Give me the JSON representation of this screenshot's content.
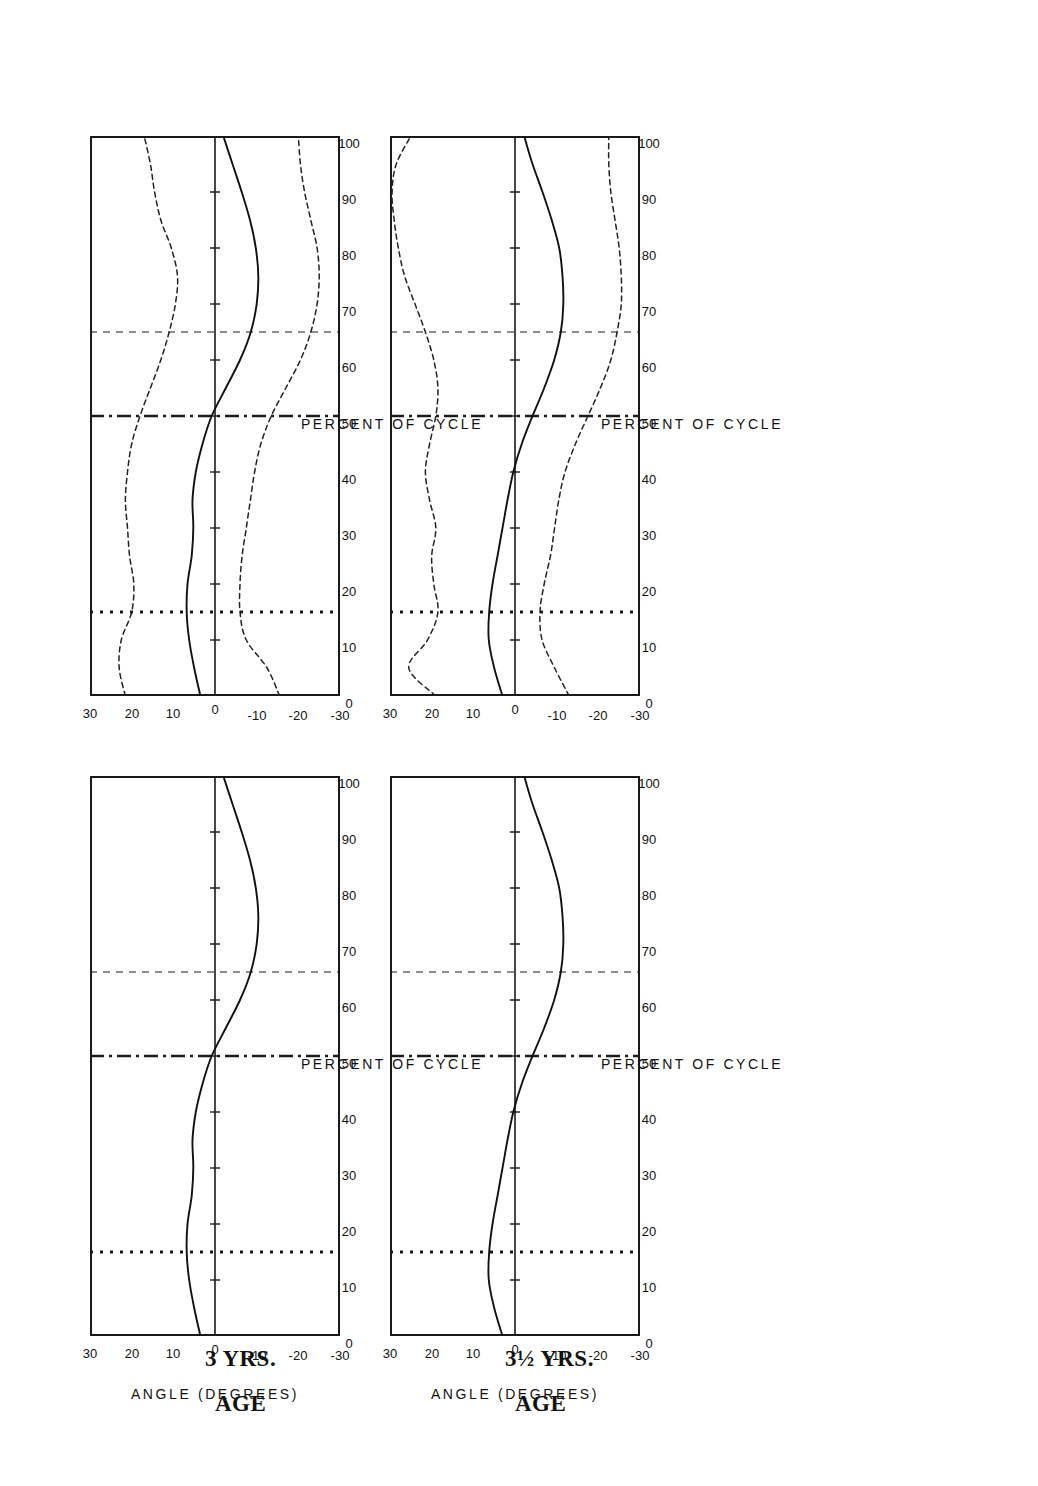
{
  "figure": {
    "title": "FEMORAL ROTATION",
    "xlabel": "PERCENT OF CYCLE",
    "ylabel_line1": "ANGLE",
    "ylabel_line2": "(DEGREES)",
    "row_labels": [
      {
        "age_word": "AGE",
        "age_value": "3 YRS."
      },
      {
        "age_word": "AGE",
        "age_value": "3½ YRS."
      }
    ],
    "xticks": [
      "0",
      "10",
      "20",
      "30",
      "40",
      "50",
      "60",
      "70",
      "80",
      "90",
      "100"
    ],
    "yticks": [
      "30",
      "20",
      "10",
      "0",
      "-10",
      "-20",
      "-30"
    ],
    "colors": {
      "ink": "#1a1a1a",
      "mean_curve": "#111111",
      "sd_curve": "#222222",
      "background": "#ffffff"
    }
  },
  "chart_data": {
    "type": "line",
    "title": "FEMORAL ROTATION",
    "xlabel": "PERCENT OF CYCLE",
    "ylabel": "ANGLE (DEGREES)",
    "xlim": [
      0,
      100
    ],
    "ylim": [
      -30,
      30
    ],
    "grid": false,
    "legend": "none",
    "x": [
      0,
      5,
      10,
      15,
      20,
      25,
      30,
      35,
      40,
      45,
      50,
      55,
      60,
      65,
      70,
      75,
      80,
      85,
      90,
      95,
      100
    ],
    "event_markers": [
      {
        "name": "opposite-toe-off",
        "percent": 15,
        "style": "dotted"
      },
      {
        "name": "opposite-foot-contact",
        "percent": 50,
        "style": "dash-dot"
      },
      {
        "name": "toe-off",
        "percent": 65,
        "style": "dashed"
      }
    ],
    "panels": [
      {
        "panel": "age-3-mean",
        "row": "AGE 3 YRS.",
        "column": "mean",
        "series": [
          {
            "name": "mean",
            "style": "solid",
            "values": [
              3.5,
              5.0,
              6.2,
              6.8,
              6.6,
              5.6,
              5.2,
              5.4,
              4.6,
              3.0,
              0.8,
              -2.6,
              -6.0,
              -8.6,
              -10.0,
              -10.4,
              -9.8,
              -8.4,
              -6.4,
              -4.2,
              -2.0
            ]
          }
        ]
      },
      {
        "panel": "age-3-mean-sd",
        "row": "AGE 3 YRS.",
        "column": "mean ± 1 SD",
        "series": [
          {
            "name": "mean",
            "style": "solid",
            "values": [
              3.5,
              5.0,
              6.2,
              6.8,
              6.6,
              5.6,
              5.2,
              5.4,
              4.6,
              3.0,
              0.8,
              -2.6,
              -6.0,
              -8.6,
              -10.0,
              -10.4,
              -9.8,
              -8.4,
              -6.4,
              -4.2,
              -2.0
            ]
          },
          {
            "name": "+1 SD",
            "style": "dashed",
            "values": [
              21.5,
              23.0,
              22.5,
              20.0,
              19.5,
              20.5,
              21.0,
              21.5,
              21.0,
              20.0,
              18.0,
              15.5,
              13.0,
              11.0,
              9.5,
              9.0,
              10.5,
              13.0,
              14.5,
              15.5,
              17.0
            ]
          },
          {
            "name": "-1 SD",
            "style": "dashed",
            "values": [
              -15.5,
              -12.5,
              -7.5,
              -6.0,
              -6.0,
              -6.5,
              -7.5,
              -8.5,
              -9.5,
              -11.0,
              -13.5,
              -17.0,
              -20.5,
              -23.0,
              -24.5,
              -25.0,
              -24.5,
              -23.0,
              -21.5,
              -20.5,
              -20.0
            ]
          }
        ]
      },
      {
        "panel": "age-3h-mean",
        "row": "AGE 3½ YRS.",
        "column": "mean",
        "series": [
          {
            "name": "mean",
            "style": "solid",
            "values": [
              3.0,
              5.0,
              6.3,
              6.2,
              5.4,
              4.2,
              3.0,
              1.8,
              0.4,
              -1.6,
              -4.2,
              -7.0,
              -9.4,
              -11.0,
              -11.6,
              -11.4,
              -10.6,
              -8.8,
              -6.6,
              -4.2,
              -2.2
            ]
          }
        ]
      },
      {
        "panel": "age-3h-mean-sd",
        "row": "AGE 3½ YRS.",
        "column": "mean ± 1 SD",
        "series": [
          {
            "name": "mean",
            "style": "solid",
            "values": [
              3.0,
              5.0,
              6.3,
              6.2,
              5.4,
              4.2,
              3.0,
              1.8,
              0.4,
              -1.6,
              -4.2,
              -7.0,
              -9.4,
              -11.0,
              -11.6,
              -11.4,
              -10.6,
              -8.8,
              -6.6,
              -4.2,
              -2.2
            ]
          },
          {
            "name": "+1 SD",
            "style": "dashed",
            "values": [
              19.0,
              25.5,
              21.0,
              18.5,
              19.5,
              20.0,
              19.0,
              20.5,
              21.5,
              20.5,
              19.0,
              18.5,
              19.5,
              21.5,
              24.0,
              26.5,
              28.0,
              29.0,
              29.5,
              28.5,
              25.0
            ]
          },
          {
            "name": "-1 SD",
            "style": "dashed",
            "values": [
              -13.0,
              -9.5,
              -6.5,
              -6.0,
              -7.0,
              -8.5,
              -9.5,
              -10.5,
              -12.0,
              -14.5,
              -17.5,
              -20.5,
              -23.0,
              -24.5,
              -25.5,
              -25.5,
              -25.0,
              -24.0,
              -23.0,
              -22.5,
              -22.5
            ]
          }
        ]
      }
    ]
  }
}
